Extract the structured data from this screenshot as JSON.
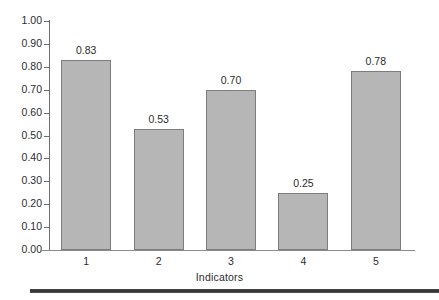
{
  "chart_data": {
    "type": "bar",
    "title": "",
    "subtitle": "",
    "xlabel": "Indicators",
    "ylabel": "",
    "categories": [
      "1",
      "2",
      "3",
      "4",
      "5"
    ],
    "values": [
      0.83,
      0.53,
      0.7,
      0.25,
      0.78
    ],
    "value_labels": [
      "0.83",
      "0.53",
      "0.70",
      "0.25",
      "0.78"
    ],
    "ylim": [
      0.0,
      1.0
    ],
    "ytick_values": [
      1.0,
      0.9,
      0.8,
      0.7,
      0.6,
      0.5,
      0.4,
      0.3,
      0.2,
      0.1,
      0.0
    ],
    "ytick_labels": [
      "1.00",
      "0.90",
      "0.80",
      "0.70",
      "0.60",
      "0.50",
      "0.40",
      "0.30",
      "0.20",
      "0.10",
      "0.00"
    ],
    "grid": false,
    "legend": null,
    "legend_position": "none",
    "series": [
      {
        "name": "",
        "values": [
          0.83,
          0.53,
          0.7,
          0.25,
          0.78
        ]
      }
    ],
    "colors": {
      "bar_fill": "#b6b6b6",
      "bar_border": "#7d7d7d",
      "axis": "#6e6e6e",
      "text": "#2b2b2b",
      "background": "#ffffff",
      "bottom_rule": "#2e2e2e"
    }
  }
}
